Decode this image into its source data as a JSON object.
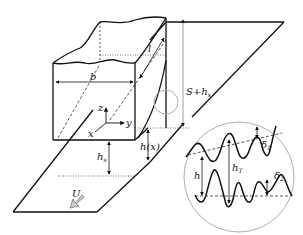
{
  "diagram": {
    "type": "slider bearing / rough surface contact schematic",
    "colors": {
      "stroke": "#111111",
      "inset_circle": "#b0b0b0",
      "arrow_fill": "#cfcfcf",
      "background": "#ffffff"
    },
    "labels": {
      "width": "b",
      "length": "l",
      "axis_z": "z",
      "axis_y": "y",
      "axis_x": "x",
      "gap_total": "S+h",
      "gap_total_sub": "s",
      "gap_min": "h",
      "gap_min_sub": "s",
      "gap_func": "h(x)",
      "velocity": "U"
    },
    "inset": {
      "film": "h",
      "film_total": "h",
      "film_total_sub": "T",
      "roughness_upper": "δ",
      "roughness_upper_sub": "1",
      "roughness_lower": "δ",
      "roughness_lower_sub": "2"
    }
  }
}
